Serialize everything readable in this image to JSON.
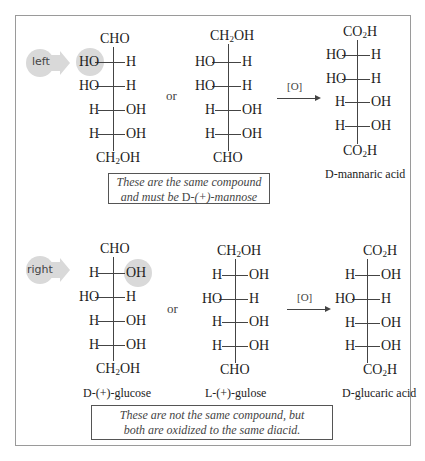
{
  "figure": {
    "top": {
      "pointer_label": "left",
      "structure_a": {
        "top_group": "CHO",
        "rows": [
          {
            "left": "HO",
            "right": "H",
            "highlight": "left"
          },
          {
            "left": "HO",
            "right": "H"
          },
          {
            "left": "H",
            "right": "OH"
          },
          {
            "left": "H",
            "right": "OH"
          }
        ],
        "bottom_group": "CH2OH"
      },
      "or_label": "or",
      "structure_b": {
        "top_group": "CH2OH",
        "rows": [
          {
            "left": "HO",
            "right": "H"
          },
          {
            "left": "HO",
            "right": "H"
          },
          {
            "left": "H",
            "right": "OH"
          },
          {
            "left": "H",
            "right": "OH"
          }
        ],
        "bottom_group": "CHO"
      },
      "reagent": "[O]",
      "product": {
        "top_group": "CO2H",
        "rows": [
          {
            "left": "HO",
            "right": "H"
          },
          {
            "left": "HO",
            "right": "H"
          },
          {
            "left": "H",
            "right": "OH"
          },
          {
            "left": "H",
            "right": "OH"
          }
        ],
        "bottom_group": "CO2H",
        "name_prefix": "D",
        "name_rest": "-mannaric acid"
      },
      "note_line1": "These are the same compound",
      "note_line2_pre": "and must be ",
      "note_line2_sc": "D",
      "note_line2_post": "-(+)-mannose"
    },
    "bottom": {
      "pointer_label": "right",
      "structure_a": {
        "top_group": "CHO",
        "rows": [
          {
            "left": "H",
            "right": "OH",
            "highlight": "right"
          },
          {
            "left": "HO",
            "right": "H"
          },
          {
            "left": "H",
            "right": "OH"
          },
          {
            "left": "H",
            "right": "OH"
          }
        ],
        "bottom_group": "CH2OH",
        "name_prefix": "D",
        "name_rest": "-(+)-glucose"
      },
      "or_label": "or",
      "structure_b": {
        "top_group": "CH2OH",
        "rows": [
          {
            "left": "H",
            "right": "OH"
          },
          {
            "left": "HO",
            "right": "H"
          },
          {
            "left": "H",
            "right": "OH"
          },
          {
            "left": "H",
            "right": "OH"
          }
        ],
        "bottom_group": "CHO",
        "name_prefix": "L",
        "name_rest": "-(+)-gulose"
      },
      "reagent": "[O]",
      "product": {
        "top_group": "CO2H",
        "rows": [
          {
            "left": "H",
            "right": "OH"
          },
          {
            "left": "HO",
            "right": "H"
          },
          {
            "left": "H",
            "right": "OH"
          },
          {
            "left": "H",
            "right": "OH"
          }
        ],
        "bottom_group": "CO2H",
        "name_prefix": "D",
        "name_rest": "-glucaric acid"
      },
      "note_line1": "These are not the same compound, but",
      "note_line2": "both are oxidized to the same diacid."
    }
  }
}
